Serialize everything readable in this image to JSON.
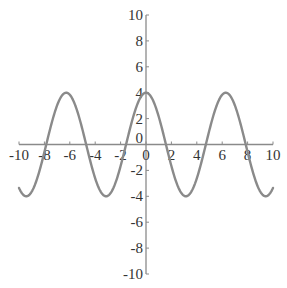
{
  "chart_data": {
    "type": "line",
    "title": "",
    "xlabel": "",
    "ylabel": "",
    "function": "y = 4cos(x)",
    "xlim": [
      -10,
      10
    ],
    "ylim": [
      -10,
      10
    ],
    "grid": false,
    "legend": null,
    "x_ticks": [
      -10,
      -8,
      -6,
      -4,
      -2,
      0,
      2,
      4,
      6,
      8,
      10
    ],
    "y_ticks": [
      -10,
      -8,
      -6,
      -4,
      -2,
      0,
      2,
      4,
      6,
      8,
      10
    ],
    "series": [
      {
        "name": "curve",
        "x": [
          -10,
          -9,
          -8,
          -7,
          -6,
          -5,
          -4,
          -3,
          -2,
          -1,
          0,
          1,
          2,
          3,
          4,
          5,
          6,
          7,
          8,
          9,
          10
        ],
        "values": [
          -3.36,
          -3.64,
          -0.58,
          3.02,
          3.84,
          1.13,
          -2.61,
          -3.96,
          -1.66,
          2.16,
          4.0,
          2.16,
          -1.66,
          -3.96,
          -2.61,
          1.13,
          3.84,
          3.02,
          -0.58,
          -3.64,
          -3.36
        ]
      }
    ]
  },
  "colors": {
    "curve": "#8a8a8a",
    "axis": "#8a8a8a",
    "text": "#333333"
  }
}
